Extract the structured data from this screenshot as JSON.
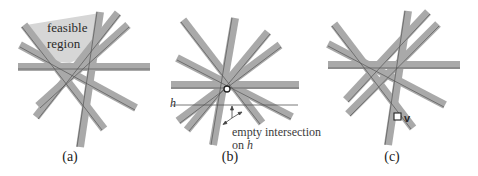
{
  "figure": {
    "panels": [
      {
        "id": "a",
        "caption": "(a)",
        "annotation_line1": "feasible",
        "annotation_line2": "region"
      },
      {
        "id": "b",
        "caption": "(b)",
        "line_label": "h",
        "annotation_line1": "empty intersection",
        "annotation_line2_prefix": "on ",
        "annotation_line2_var": "h"
      },
      {
        "id": "c",
        "caption": "(c)",
        "vertex_label": "v"
      }
    ],
    "colors": {
      "strip_fill": "#a9a9a9",
      "strip_edge": "#555555",
      "feasible_fill": "#d6d6d6",
      "background": "#ffffff",
      "line": "#555555"
    }
  }
}
